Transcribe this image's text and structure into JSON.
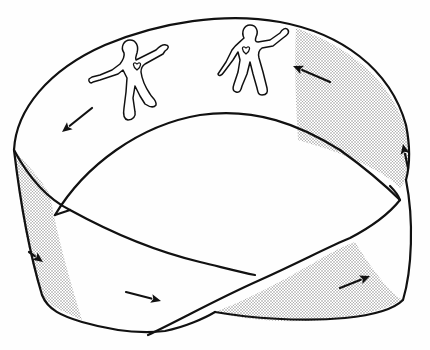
{
  "diagram": {
    "colors": {
      "ink": "#111111",
      "paper": "#fefefe",
      "shade_dot": "#8a8a8a"
    },
    "shaded_regions": [
      {
        "name": "shade-top-right",
        "d": "M296,28 C345,45 392,78 408,135 C411,152 410,168 406,180 L400,188 C388,175 360,160 324,148 L298,140 C296,105 294,65 296,28 Z"
      },
      {
        "name": "shade-left-lower",
        "d": "M14,150 C18,195 27,250 40,290 C44,300 52,306 60,310 L82,320 C70,280 58,240 50,195 C42,180 28,165 14,150 Z"
      },
      {
        "name": "shade-bottom-right",
        "d": "M215,312 C262,294 300,270 340,248 L355,242 C372,270 392,295 403,300 C380,312 350,318 325,320 C280,323 245,320 215,312 Z"
      }
    ],
    "edges": [
      {
        "name": "outer-top-edge",
        "d": "M14,150 C16,110 48,70 105,45 C160,22 225,12 280,22 C340,33 390,68 406,125 C410,145 410,165 406,180"
      },
      {
        "name": "inner-top-edge",
        "d": "M55,215 C85,165 140,125 200,115 C255,107 300,125 340,150 C365,168 385,185 400,200"
      },
      {
        "name": "left-outer-edge",
        "d": "M14,150 C20,200 30,255 42,295 C48,310 62,316 82,322 C110,330 140,334 165,331 C185,327 205,318 215,312"
      },
      {
        "name": "left-inner-edge",
        "d": "M14,150 C30,180 50,200 70,210 C110,232 150,250 200,262 C225,268 240,272 255,275"
      },
      {
        "name": "inner-left-connector",
        "d": "M55,215 L70,210"
      },
      {
        "name": "twist-crossing-a",
        "d": "M148,335 C180,320 215,300 260,280 C300,262 330,246 350,238 C375,225 392,210 400,200"
      },
      {
        "name": "twist-crossing-b",
        "d": "M215,312 C250,318 300,322 345,318 C375,315 395,308 403,300 C412,270 414,220 406,180"
      },
      {
        "name": "right-inner-lip",
        "d": "M400,200 C398,194 394,190 390,186"
      }
    ],
    "arrows": [
      {
        "name": "arrow-top-left",
        "from": [
          92,
          108
        ],
        "to": [
          62,
          132
        ]
      },
      {
        "name": "arrow-top-right",
        "from": [
          330,
          82
        ],
        "to": [
          293,
          66
        ]
      },
      {
        "name": "arrow-right-edge",
        "from": [
          408,
          168
        ],
        "to": [
          403,
          144
        ]
      },
      {
        "name": "arrow-left-lower",
        "from": [
          29,
          252
        ],
        "to": [
          43,
          262
        ]
      },
      {
        "name": "arrow-bottom-middle",
        "from": [
          126,
          292
        ],
        "to": [
          161,
          301
        ]
      },
      {
        "name": "arrow-bottom-right",
        "from": [
          340,
          288
        ],
        "to": [
          370,
          276
        ]
      }
    ],
    "figures": [
      {
        "name": "figure-left",
        "d": "M124,53 C120,47 124,40 130,40 C136,40 139,46 137,53 C136,56 135,58 136,60 L156,50 C159,47 163,44 166,45 C170,46 168,49 165,51 L163,54 L145,64 C142,66 141,68 141,72 C142,80 146,88 150,94 C152,98 157,100 156,105 C153,109 148,106 145,104 L140,96 L135,86 L133,98 L135,112 C136,116 133,120 128,120 C123,119 123,114 124,108 L126,92 L127,78 L123,70 L118,74 L100,80 L93,82 C91,84 88,82 89,79 L92,77 L100,75 L112,70 L120,64 C123,60 125,57 124,53 Z",
        "heart": {
          "cx": 137,
          "cy": 66
        }
      },
      {
        "name": "figure-right",
        "d": "M244,38 C241,32 244,25 250,25 C256,25 259,31 256,37 C255,40 255,42 258,42 L270,40 L280,33 C282,29 286,27 288,30 C290,33 286,36 283,38 L273,46 L262,48 C259,50 258,54 259,58 L263,72 L267,88 C268,92 267,95 262,95 C258,95 258,92 257,88 L253,74 L250,62 L247,74 L242,86 C241,90 240,93 236,92 C232,91 233,87 234,84 L238,72 L240,60 L238,52 L233,60 L224,72 C222,75 219,77 218,74 L220,71 L226,62 L232,50 C236,44 240,42 244,38 Z",
        "heart": {
          "cx": 246,
          "cy": 50
        }
      }
    ]
  }
}
